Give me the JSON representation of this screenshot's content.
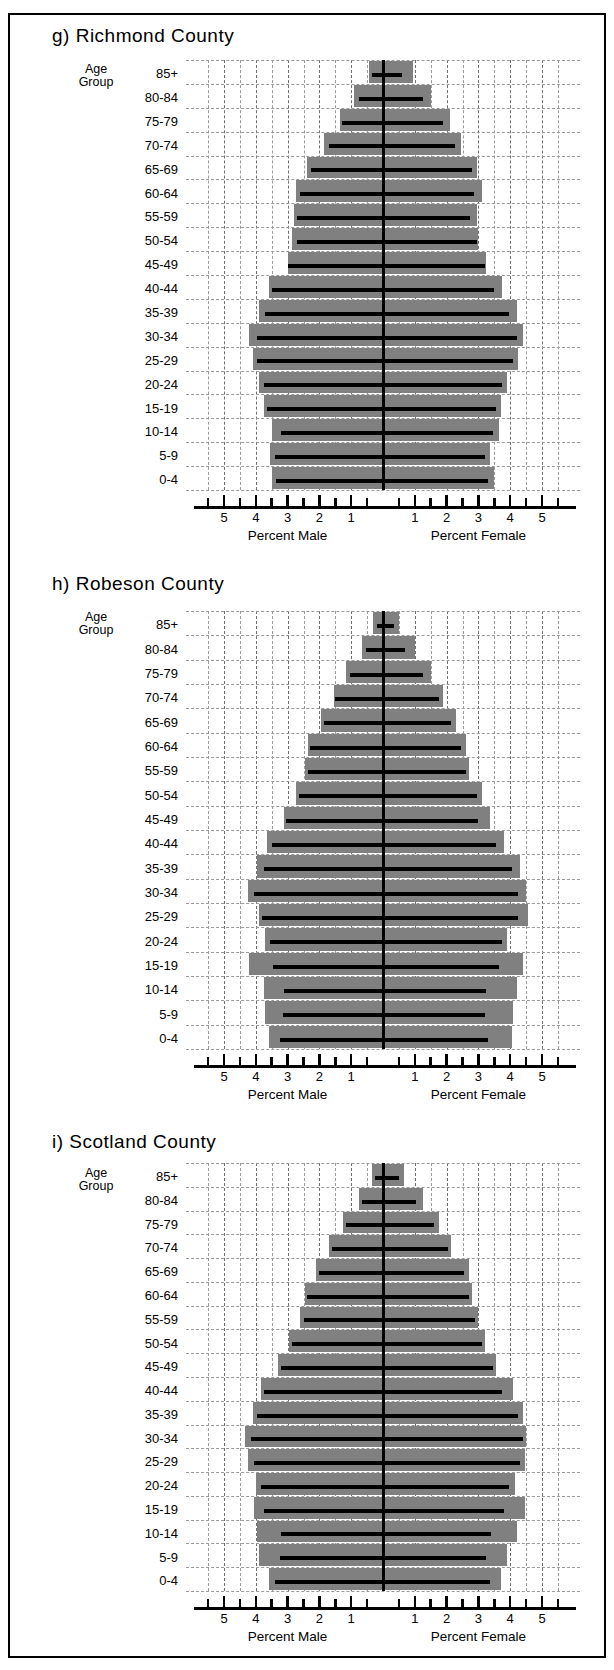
{
  "figure": {
    "panels": [
      {
        "id": "panel-richmond",
        "title": "g) Richmond County",
        "axis_left_caption": "Percent Male",
        "axis_right_caption": "Percent Female",
        "age_group_line1": "Age",
        "age_group_line2": "Group"
      },
      {
        "id": "panel-robeson",
        "title": "h) Robeson County",
        "axis_left_caption": "Percent Male",
        "axis_right_caption": "Percent Female",
        "age_group_line1": "Age",
        "age_group_line2": "Group"
      },
      {
        "id": "panel-scotland",
        "title": "i) Scotland County",
        "axis_left_caption": "Percent Male",
        "axis_right_caption": "Percent Female",
        "age_group_line1": "Age",
        "age_group_line2": "Group"
      }
    ],
    "tick_labels_left": [
      "5",
      "4",
      "3",
      "2",
      "1"
    ],
    "tick_labels_right": [
      "1",
      "2",
      "3",
      "4",
      "5"
    ],
    "age_groups": [
      "85+",
      "80-84",
      "75-79",
      "70-74",
      "65-69",
      "60-64",
      "55-59",
      "50-54",
      "45-49",
      "40-44",
      "35-39",
      "30-34",
      "25-29",
      "20-24",
      "15-19",
      "10-14",
      "5-9",
      "0-4"
    ]
  },
  "chart_data": [
    {
      "type": "bar",
      "orientation": "horizontal",
      "subtype": "population-pyramid",
      "title": "g) Richmond County",
      "xlabel_left": "Percent Male",
      "xlabel_right": "Percent Female",
      "ylabel": "Age Group",
      "xlim": [
        -5.7,
        5.7
      ],
      "xticks": [
        5,
        4,
        3,
        2,
        1,
        1,
        2,
        3,
        4,
        5
      ],
      "grid": true,
      "categories": [
        "85+",
        "80-84",
        "75-79",
        "70-74",
        "65-69",
        "60-64",
        "55-59",
        "50-54",
        "45-49",
        "40-44",
        "35-39",
        "30-34",
        "25-29",
        "20-24",
        "15-19",
        "10-14",
        "5-9",
        "0-4"
      ],
      "series": [
        {
          "name": "Percent Male (gray bar)",
          "side": "left",
          "values": [
            0.45,
            0.9,
            1.35,
            1.85,
            2.4,
            2.75,
            2.8,
            2.85,
            3.0,
            3.6,
            3.9,
            4.2,
            4.1,
            3.9,
            3.75,
            3.5,
            3.55,
            3.5
          ]
        },
        {
          "name": "Percent Female (gray bar)",
          "side": "right",
          "values": [
            0.95,
            1.5,
            2.1,
            2.45,
            2.95,
            3.1,
            2.95,
            3.0,
            3.25,
            3.75,
            4.2,
            4.4,
            4.25,
            3.9,
            3.7,
            3.65,
            3.35,
            3.5
          ]
        },
        {
          "name": "Reference line male",
          "side": "left",
          "style": "line",
          "values": [
            0.35,
            0.75,
            1.3,
            1.7,
            2.25,
            2.6,
            2.7,
            2.7,
            3.0,
            3.5,
            3.7,
            3.95,
            3.95,
            3.75,
            3.65,
            3.2,
            3.4,
            3.35
          ]
        },
        {
          "name": "Reference line female",
          "side": "right",
          "style": "line",
          "values": [
            0.6,
            1.25,
            1.9,
            2.25,
            2.8,
            2.85,
            2.75,
            2.95,
            3.2,
            3.5,
            3.95,
            4.2,
            4.1,
            3.75,
            3.55,
            3.45,
            3.2,
            3.3
          ]
        }
      ]
    },
    {
      "type": "bar",
      "orientation": "horizontal",
      "subtype": "population-pyramid",
      "title": "h) Robeson County",
      "xlabel_left": "Percent Male",
      "xlabel_right": "Percent Female",
      "ylabel": "Age Group",
      "xlim": [
        -5.7,
        5.7
      ],
      "xticks": [
        5,
        4,
        3,
        2,
        1,
        1,
        2,
        3,
        4,
        5
      ],
      "grid": true,
      "categories": [
        "85+",
        "80-84",
        "75-79",
        "70-74",
        "65-69",
        "60-64",
        "55-59",
        "50-54",
        "45-49",
        "40-44",
        "35-39",
        "30-34",
        "25-29",
        "20-24",
        "15-19",
        "10-14",
        "5-9",
        "0-4"
      ],
      "series": [
        {
          "name": "Percent Male (gray bar)",
          "side": "left",
          "values": [
            0.3,
            0.65,
            1.15,
            1.55,
            1.95,
            2.35,
            2.45,
            2.75,
            3.1,
            3.65,
            3.95,
            4.25,
            3.9,
            3.7,
            4.2,
            3.75,
            3.7,
            3.6
          ]
        },
        {
          "name": "Percent Female (gray bar)",
          "side": "right",
          "values": [
            0.5,
            1.0,
            1.5,
            1.9,
            2.3,
            2.6,
            2.7,
            3.1,
            3.35,
            3.8,
            4.3,
            4.5,
            4.55,
            3.9,
            4.4,
            4.2,
            4.1,
            4.05
          ]
        },
        {
          "name": "Reference line male",
          "side": "left",
          "style": "line",
          "values": [
            0.2,
            0.55,
            1.05,
            1.5,
            1.85,
            2.3,
            2.35,
            2.65,
            3.05,
            3.5,
            3.75,
            4.05,
            3.8,
            3.55,
            3.45,
            3.1,
            3.15,
            3.25
          ]
        },
        {
          "name": "Reference line female",
          "side": "right",
          "style": "line",
          "values": [
            0.35,
            0.7,
            1.25,
            1.75,
            2.15,
            2.45,
            2.6,
            2.95,
            3.0,
            3.55,
            4.05,
            4.25,
            4.25,
            3.75,
            3.65,
            3.25,
            3.2,
            3.3
          ]
        }
      ]
    },
    {
      "type": "bar",
      "orientation": "horizontal",
      "subtype": "population-pyramid",
      "title": "i) Scotland County",
      "xlabel_left": "Percent Male",
      "xlabel_right": "Percent Female",
      "ylabel": "Age Group",
      "xlim": [
        -5.7,
        5.7
      ],
      "xticks": [
        5,
        4,
        3,
        2,
        1,
        1,
        2,
        3,
        4,
        5
      ],
      "grid": true,
      "categories": [
        "85+",
        "80-84",
        "75-79",
        "70-74",
        "65-69",
        "60-64",
        "55-59",
        "50-54",
        "45-49",
        "40-44",
        "35-39",
        "30-34",
        "25-29",
        "20-24",
        "15-19",
        "10-14",
        "5-9",
        "0-4"
      ],
      "series": [
        {
          "name": "Percent Male (gray bar)",
          "side": "left",
          "values": [
            0.35,
            0.75,
            1.25,
            1.7,
            2.1,
            2.45,
            2.6,
            2.95,
            3.3,
            3.85,
            4.1,
            4.35,
            4.25,
            4.0,
            4.05,
            3.95,
            3.9,
            3.6
          ]
        },
        {
          "name": "Percent Female (gray bar)",
          "side": "right",
          "values": [
            0.65,
            1.25,
            1.75,
            2.15,
            2.7,
            2.8,
            3.0,
            3.2,
            3.55,
            4.1,
            4.4,
            4.5,
            4.45,
            4.15,
            4.45,
            4.2,
            3.9,
            3.7
          ]
        },
        {
          "name": "Reference line male",
          "side": "left",
          "style": "line",
          "values": [
            0.25,
            0.65,
            1.15,
            1.6,
            2.0,
            2.4,
            2.5,
            2.85,
            3.2,
            3.75,
            3.95,
            4.15,
            4.05,
            3.85,
            3.75,
            3.2,
            3.25,
            3.4
          ]
        },
        {
          "name": "Reference line female",
          "side": "right",
          "style": "line",
          "values": [
            0.5,
            1.05,
            1.6,
            2.05,
            2.55,
            2.7,
            2.9,
            3.1,
            3.45,
            3.75,
            4.25,
            4.4,
            4.3,
            3.95,
            3.8,
            3.4,
            3.25,
            3.35
          ]
        }
      ]
    }
  ]
}
